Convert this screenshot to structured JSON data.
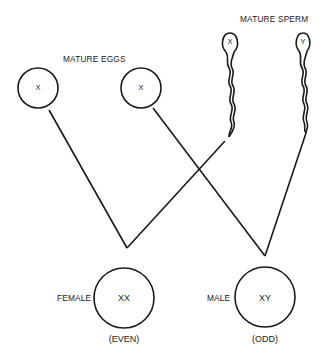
{
  "diagram": {
    "type": "sex-determination-cross",
    "colors": {
      "ink": "#1a1a1a",
      "background": "#ffffff"
    },
    "labels": {
      "eggs_heading": "MATURE EGGS",
      "sperm_heading": "MATURE SPERM"
    },
    "eggs": [
      {
        "chromosome": "X"
      },
      {
        "chromosome": "X"
      }
    ],
    "sperm": [
      {
        "chromosome": "X"
      },
      {
        "chromosome": "Y"
      }
    ],
    "offspring": [
      {
        "sex": "FEMALE",
        "genotype": "XX",
        "note": "(EVEN)"
      },
      {
        "sex": "MALE",
        "genotype": "XY",
        "note": "(ODD)"
      }
    ]
  }
}
